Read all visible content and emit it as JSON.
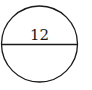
{
  "diagram": {
    "shape": "circle",
    "diameter_label": "12",
    "stroke_color": "#1a1a1a",
    "background": "#ffffff"
  }
}
